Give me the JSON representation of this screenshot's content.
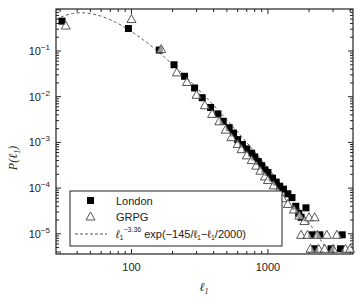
{
  "chart_data": {
    "type": "scatter",
    "title": "",
    "xlabel": "ℓ1",
    "ylabel": "P(ℓ1)",
    "xscale": "log",
    "yscale": "log",
    "xlim": [
      28,
      4200
    ],
    "ylim": [
      3e-06,
      0.8
    ],
    "x_ticks": [
      {
        "value": 100,
        "label": "100"
      },
      {
        "value": 1000,
        "label": "1000"
      }
    ],
    "y_ticks": [
      {
        "value": 0.1,
        "base": "10",
        "exp": "−1"
      },
      {
        "value": 0.01,
        "base": "10",
        "exp": "−2"
      },
      {
        "value": 0.001,
        "base": "10",
        "exp": "−3"
      },
      {
        "value": 0.0001,
        "base": "10",
        "exp": "−4"
      },
      {
        "value": 1e-05,
        "base": "10",
        "exp": "−5"
      }
    ],
    "grid": false,
    "legend_position": "lower left",
    "series": [
      {
        "name": "London",
        "marker": "filled-square",
        "color": "#000000",
        "points": [
          [
            31,
            0.45
          ],
          [
            95,
            0.31
          ],
          [
            160,
            0.105
          ],
          [
            205,
            0.05
          ],
          [
            245,
            0.028
          ],
          [
            290,
            0.0155
          ],
          [
            330,
            0.0095
          ],
          [
            380,
            0.0058
          ],
          [
            430,
            0.0042
          ],
          [
            470,
            0.0029
          ],
          [
            520,
            0.0021
          ],
          [
            560,
            0.0016
          ],
          [
            600,
            0.00115
          ],
          [
            650,
            0.0009
          ],
          [
            700,
            0.00072
          ],
          [
            760,
            0.00058
          ],
          [
            800,
            0.00048
          ],
          [
            850,
            0.00038
          ],
          [
            900,
            0.00031
          ],
          [
            950,
            0.00025
          ],
          [
            1000,
            0.00022
          ],
          [
            1080,
            0.000165
          ],
          [
            1150,
            0.000135
          ],
          [
            1220,
            0.00011
          ],
          [
            1300,
            9.5e-05
          ],
          [
            1400,
            7.5e-05
          ],
          [
            1500,
            6.2e-05
          ],
          [
            1600,
            4e-05
          ],
          [
            1680,
            2.8e-05
          ],
          [
            1750,
            2.3e-05
          ],
          [
            1900,
            3.7e-05
          ],
          [
            2100,
            9.5e-06
          ],
          [
            2400,
            9.5e-06
          ],
          [
            3500,
            9.5e-06
          ],
          [
            2200,
            4.7e-06
          ],
          [
            2900,
            4.7e-06
          ],
          [
            3400,
            4.7e-06
          ]
        ]
      },
      {
        "name": "GRPG",
        "marker": "open-triangle",
        "color": "#000000",
        "points": [
          [
            33,
            0.36
          ],
          [
            100,
            0.5
          ],
          [
            165,
            0.11
          ],
          [
            215,
            0.034
          ],
          [
            255,
            0.021
          ],
          [
            300,
            0.011
          ],
          [
            345,
            0.0065
          ],
          [
            390,
            0.0042
          ],
          [
            440,
            0.0029
          ],
          [
            490,
            0.0019
          ],
          [
            540,
            0.0013
          ],
          [
            600,
            0.00092
          ],
          [
            640,
            0.00071
          ],
          [
            700,
            0.00052
          ],
          [
            760,
            0.00041
          ],
          [
            820,
            0.00031
          ],
          [
            880,
            0.00024
          ],
          [
            950,
            0.00018
          ],
          [
            1000,
            0.00015
          ],
          [
            1100,
            0.000115
          ],
          [
            1180,
            8.2e-05
          ],
          [
            1280,
            6e-05
          ],
          [
            1400,
            4.5e-05
          ],
          [
            1550,
            3.4e-05
          ],
          [
            1700,
            2.5e-05
          ],
          [
            1850,
            1.9e-05
          ],
          [
            2000,
            2.3e-05
          ],
          [
            2200,
            2.3e-05
          ],
          [
            1750,
            9.5e-06
          ],
          [
            1950,
            9.5e-06
          ],
          [
            2300,
            9.5e-06
          ],
          [
            2700,
            9.5e-06
          ],
          [
            3200,
            9.5e-06
          ],
          [
            2050,
            4.7e-06
          ],
          [
            2350,
            4.7e-06
          ],
          [
            2600,
            4.7e-06
          ],
          [
            3000,
            4.7e-06
          ],
          [
            3700,
            4.7e-06
          ],
          [
            4000,
            4.7e-06
          ]
        ]
      },
      {
        "name": "ℓ1^−3.36 exp(−145/ℓ1−ℓ1/2000)",
        "marker": "dashed-line",
        "color": "#555555",
        "formula": "C * l^-3.36 * exp(-145/l - l/2000)",
        "exponent": -3.36,
        "a": 145,
        "b": 2000
      }
    ],
    "legend": [
      {
        "marker": "filled-square",
        "label": "London"
      },
      {
        "marker": "open-triangle",
        "label": "GRPG"
      },
      {
        "marker": "dashed-line",
        "label_prefix": "ℓ",
        "label_sub": "1",
        "label_sup": "−3.36",
        "label_rest": " exp(−145/ℓ",
        "label_sub2": "1",
        "label_mid": "−ℓ",
        "label_sub3": "1",
        "label_end": "/2000)"
      }
    ]
  }
}
